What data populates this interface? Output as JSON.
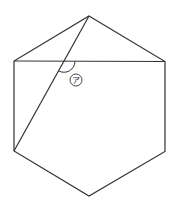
{
  "diagram": {
    "type": "geometry",
    "shape": "regular hexagon",
    "stroke_color": "#333333",
    "background": "#ffffff",
    "vertices": {
      "top": [
        89,
        16
      ],
      "top_right": [
        165,
        61.5
      ],
      "bottom_right": [
        165,
        151.5
      ],
      "bottom": [
        89,
        196
      ],
      "bottom_left": [
        14,
        151
      ],
      "top_left": [
        14,
        61
      ]
    },
    "segments": [
      {
        "name": "horizontal-diagonal",
        "from": "top_left",
        "to": "top_right"
      },
      {
        "name": "slant-diagonal",
        "from": "top",
        "to": "bottom_left"
      }
    ],
    "intersection": [
      64,
      61.3
    ],
    "angle_label": {
      "text": "ア",
      "circled": true,
      "position": [
        76,
        80
      ],
      "description": "angle at intersection of diagonals, obtuse (below horizontal, right of slant)"
    }
  }
}
